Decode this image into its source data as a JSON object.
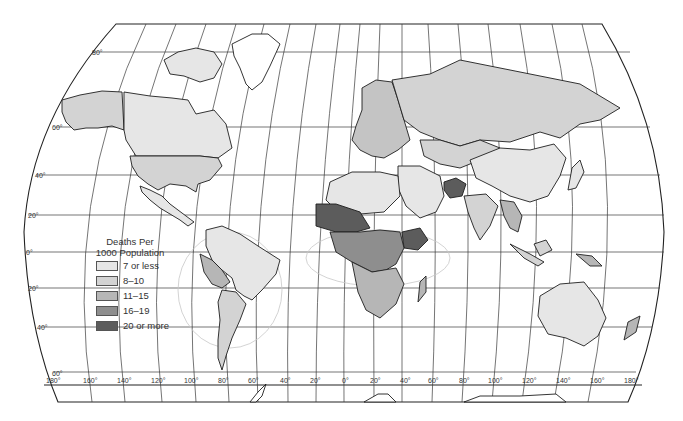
{
  "map": {
    "title": "Deaths Per 1000 Population",
    "projection_type": "world"
  },
  "legend": {
    "title_line1": "Deaths Per",
    "title_line2": "1000 Population",
    "items": [
      {
        "label": "7 or less",
        "color": "#e6e6e6"
      },
      {
        "label": "8–10",
        "color": "#d3d3d3"
      },
      {
        "label": "11–15",
        "color": "#b6b6b6"
      },
      {
        "label": "16–19",
        "color": "#8e8e8e"
      },
      {
        "label": "20 or more",
        "color": "#5c5c5c"
      }
    ]
  },
  "axes": {
    "longitude_labels": [
      "180°",
      "160°",
      "140°",
      "120°",
      "100°",
      "80°",
      "60°",
      "40°",
      "20°",
      "0°",
      "20°",
      "40°",
      "60°",
      "80°",
      "100°",
      "120°",
      "140°",
      "160°",
      "180°"
    ],
    "latitude_labels": [
      "80°",
      "60°",
      "40°",
      "20°",
      "0°",
      "20°",
      "40°",
      "60°"
    ]
  },
  "regions": {
    "north_america": {
      "usa": "8–10",
      "canada": "7 or less",
      "alaska": "8–10",
      "mexico": "7 or less"
    },
    "south_america": {
      "brazil": "7 or less",
      "argentina": "8–10",
      "bolivia_peru": "11–15"
    },
    "europe": "8–10 to 11–15",
    "russia": "8–10",
    "china": "7 or less",
    "africa_west_sahel": "20 or more",
    "ethiopia": "20 or more",
    "afghanistan": "20 or more",
    "australia": "7 or less"
  }
}
